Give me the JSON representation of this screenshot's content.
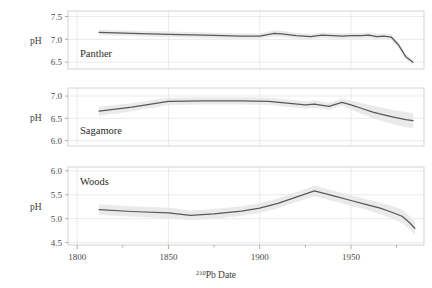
{
  "figure": {
    "background_color": "#ffffff",
    "line_color": "#595959",
    "band_color": "#e6e6e6",
    "grid_color": "#e2e2e2",
    "frame_color": "#c9c9c9"
  },
  "axis": {
    "x_title_prefix": "210",
    "x_title_main": "Pb Date",
    "x_title_full": "210Pb Date",
    "y_title": "pH",
    "x_major_ticks": [
      1800,
      1850,
      1900,
      1950
    ],
    "x_major_labels": [
      "1800",
      "1850",
      "1900",
      "1950"
    ],
    "x_minor_ticks": [
      1825,
      1875,
      1925,
      1975
    ],
    "xlim": [
      1795,
      1990
    ]
  },
  "chart_data": {
    "type": "line",
    "title": "",
    "xlabel": "210Pb Date",
    "ylabel": "pH",
    "grid": true,
    "legend": "none",
    "layout": "3 stacked panels sharing x-axis",
    "panels": [
      {
        "name": "Panther",
        "label": "Panther",
        "ylabel": "pH",
        "ylim": [
          6.35,
          7.62
        ],
        "yticks": [
          6.5,
          7.0,
          7.5
        ],
        "ytick_labels": [
          "6.5",
          "7.0",
          "7.5"
        ],
        "series": [
          {
            "name": "Panther pH reconstruction",
            "x": [
              1812,
              1830,
              1850,
              1870,
              1890,
              1900,
              1908,
              1912,
              1920,
              1928,
              1934,
              1940,
              1945,
              1950,
              1955,
              1960,
              1964,
              1968,
              1972,
              1976,
              1980,
              1984
            ],
            "values": [
              7.15,
              7.13,
              7.11,
              7.09,
              7.07,
              7.07,
              7.13,
              7.12,
              7.08,
              7.06,
              7.09,
              7.08,
              7.07,
              7.08,
              7.08,
              7.09,
              7.06,
              7.07,
              7.05,
              6.88,
              6.62,
              6.5
            ],
            "band_lower": [
              7.09,
              7.07,
              7.05,
              7.03,
              7.01,
              7.01,
              7.06,
              7.05,
              7.02,
              7.0,
              7.03,
              7.02,
              7.01,
              7.02,
              7.02,
              7.03,
              7.0,
              7.01,
              6.99,
              6.82,
              6.56,
              6.44
            ],
            "band_upper": [
              7.21,
              7.19,
              7.17,
              7.15,
              7.13,
              7.13,
              7.2,
              7.19,
              7.14,
              7.12,
              7.15,
              7.14,
              7.13,
              7.14,
              7.14,
              7.15,
              7.12,
              7.13,
              7.11,
              6.94,
              6.68,
              6.56
            ]
          }
        ]
      },
      {
        "name": "Sagamore",
        "label": "Sagamore",
        "ylabel": "pH",
        "ylim": [
          5.88,
          7.18
        ],
        "yticks": [
          6.0,
          6.5,
          7.0
        ],
        "ytick_labels": [
          "6.0",
          "6.5",
          "7.0"
        ],
        "series": [
          {
            "name": "Sagamore pH reconstruction",
            "x": [
              1812,
              1830,
              1850,
              1870,
              1890,
              1905,
              1915,
              1925,
              1930,
              1938,
              1945,
              1950,
              1956,
              1962,
              1968,
              1974,
              1980,
              1984
            ],
            "values": [
              6.66,
              6.75,
              6.88,
              6.89,
              6.89,
              6.88,
              6.84,
              6.8,
              6.82,
              6.77,
              6.86,
              6.8,
              6.72,
              6.64,
              6.58,
              6.52,
              6.47,
              6.45
            ],
            "band_lower": [
              6.56,
              6.66,
              6.8,
              6.81,
              6.81,
              6.8,
              6.76,
              6.72,
              6.74,
              6.69,
              6.78,
              6.7,
              6.6,
              6.5,
              6.43,
              6.36,
              6.3,
              6.28
            ],
            "band_upper": [
              6.76,
              6.84,
              6.96,
              6.97,
              6.97,
              6.96,
              6.92,
              6.88,
              6.9,
              6.85,
              6.94,
              6.9,
              6.84,
              6.78,
              6.73,
              6.68,
              6.64,
              6.62
            ]
          }
        ]
      },
      {
        "name": "Woods",
        "label": "Woods",
        "ylabel": "pH",
        "ylim": [
          4.45,
          6.08
        ],
        "yticks": [
          4.5,
          5.0,
          5.5,
          6.0
        ],
        "ytick_labels": [
          "4.5",
          "5.0",
          "5.5",
          "6.0"
        ],
        "series": [
          {
            "name": "Woods pH reconstruction",
            "x": [
              1812,
              1830,
              1850,
              1862,
              1875,
              1890,
              1900,
              1910,
              1920,
              1930,
              1940,
              1950,
              1958,
              1966,
              1972,
              1978,
              1982,
              1985
            ],
            "values": [
              5.19,
              5.15,
              5.12,
              5.07,
              5.1,
              5.16,
              5.22,
              5.32,
              5.45,
              5.58,
              5.48,
              5.38,
              5.3,
              5.22,
              5.14,
              5.05,
              4.92,
              4.8
            ],
            "band_lower": [
              5.08,
              5.04,
              5.01,
              4.97,
              5.0,
              5.06,
              5.12,
              5.22,
              5.35,
              5.47,
              5.37,
              5.27,
              5.19,
              5.1,
              5.01,
              4.91,
              4.78,
              4.66
            ],
            "band_upper": [
              5.3,
              5.26,
              5.23,
              5.17,
              5.2,
              5.26,
              5.32,
              5.42,
              5.55,
              5.69,
              5.59,
              5.49,
              5.41,
              5.34,
              5.27,
              5.19,
              5.06,
              4.94
            ]
          }
        ]
      }
    ]
  }
}
